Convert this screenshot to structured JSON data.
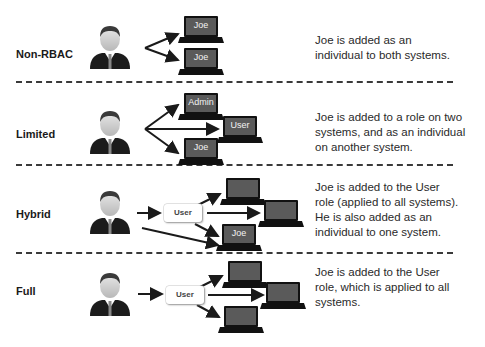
{
  "sections": [
    {
      "id": "non-rbac",
      "label": "Non-RBAC",
      "description_lines": [
        "Joe is added as an",
        "individual to both systems."
      ],
      "systems": [
        "Joe",
        "Joe"
      ]
    },
    {
      "id": "limited",
      "label": "Limited",
      "description_lines": [
        "Joe is added to a role on two",
        "systems, and as an individual",
        "on another system."
      ],
      "systems": [
        "Admin",
        "User",
        "Joe"
      ]
    },
    {
      "id": "hybrid",
      "label": "Hybrid",
      "role": "User",
      "description_lines": [
        "Joe is added to the User",
        "role (applied to all systems).",
        "He is also added as an",
        "individual to one system."
      ],
      "systems": [
        "",
        "",
        "Joe"
      ]
    },
    {
      "id": "full",
      "label": "Full",
      "role": "User",
      "description_lines": [
        "Joe is added to the User",
        "role, which is applied to all",
        "systems."
      ],
      "systems": [
        "",
        "",
        ""
      ]
    }
  ],
  "icons": {
    "person": "person-icon",
    "laptop": "laptop-icon",
    "arrow": "arrow-icon"
  },
  "colors": {
    "laptop_screen": "#5a5a5a",
    "laptop_body": "#111111",
    "arrow": "#1a1a1a",
    "divider": "#3a3a3a"
  }
}
